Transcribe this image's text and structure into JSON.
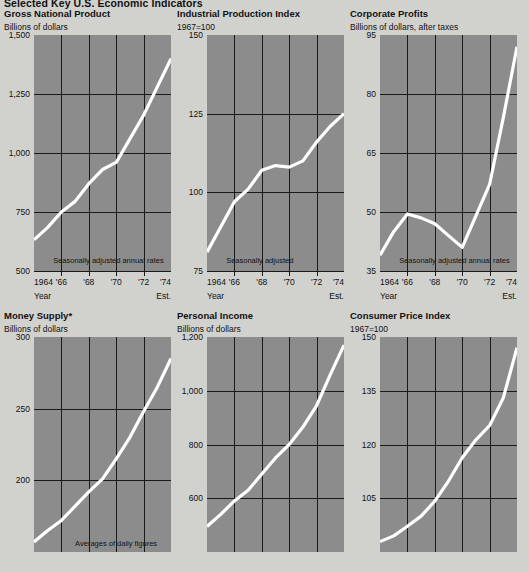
{
  "page": {
    "title": "Selected Key U.S. Economic Indicators"
  },
  "axis": {
    "x_tick_labels": [
      "1964",
      "'66",
      "'68",
      "'70",
      "'72",
      "'74"
    ],
    "x_foot_left": "Year",
    "x_foot_right": "Est."
  },
  "chart_data": [
    {
      "type": "line",
      "title": "Gross National Product",
      "units": "Billions of dollars",
      "ylabel": "Billions of dollars",
      "xlabel": "Year",
      "annotation": "Seasonally adjusted annual rates",
      "ylim": [
        500,
        1500
      ],
      "ytick_labels": [
        "1,500",
        "1,250",
        "1,000",
        "750",
        "500"
      ],
      "yticks": [
        1500,
        1250,
        1000,
        750,
        500
      ],
      "gridlines_y": [
        1250,
        1000,
        750
      ],
      "grid": true,
      "x": [
        1964,
        1965,
        1966,
        1967,
        1968,
        1969,
        1970,
        1971,
        1972,
        1973,
        1974
      ],
      "categories": [
        "1964",
        "'66",
        "'68",
        "'70",
        "'72",
        "'74"
      ],
      "values": [
        632,
        685,
        750,
        795,
        870,
        930,
        960,
        1060,
        1160,
        1280,
        1400
      ]
    },
    {
      "type": "line",
      "title": "Industrial Production Index",
      "units": "1967=100",
      "ylabel": "1967=100",
      "xlabel": "Year",
      "annotation": "Seasonally adjusted",
      "ylim": [
        75,
        150
      ],
      "ytick_labels": [
        "150",
        "125",
        "100",
        "75"
      ],
      "yticks": [
        150,
        125,
        100,
        75
      ],
      "gridlines_y": [
        125,
        100
      ],
      "grid": true,
      "x": [
        1964,
        1965,
        1966,
        1967,
        1968,
        1969,
        1970,
        1971,
        1972,
        1973,
        1974
      ],
      "categories": [
        "1964",
        "'66",
        "'68",
        "'70",
        "'72",
        "'74"
      ],
      "values": [
        81,
        89,
        97,
        101,
        107,
        108.5,
        108,
        110,
        116,
        121,
        125
      ]
    },
    {
      "type": "line",
      "title": "Corporate Profits",
      "units": "Billions of dollars, after taxes",
      "ylabel": "Billions of dollars, after taxes",
      "xlabel": "Year",
      "annotation": "Seasonally adjusted annual rates",
      "ylim": [
        35,
        95
      ],
      "ytick_labels": [
        "95",
        "80",
        "65",
        "50",
        "35"
      ],
      "yticks": [
        95,
        80,
        65,
        50,
        35
      ],
      "gridlines_y": [
        80,
        65,
        50
      ],
      "grid": true,
      "x": [
        1964,
        1965,
        1966,
        1967,
        1968,
        1969,
        1970,
        1971,
        1972,
        1973,
        1974
      ],
      "categories": [
        "1964",
        "'66",
        "'68",
        "'70",
        "'72",
        "'74"
      ],
      "values": [
        39,
        45,
        49.5,
        48.5,
        47,
        44,
        41,
        49,
        57,
        74,
        92
      ]
    },
    {
      "type": "line",
      "title": "Money Supply*",
      "units": "Billions of dollars",
      "ylabel": "Billions of dollars",
      "xlabel": "Year",
      "annotation": "Averages of daily figures",
      "ylim": [
        150,
        300
      ],
      "ytick_labels": [
        "300",
        "250",
        "200"
      ],
      "yticks": [
        300,
        250,
        200
      ],
      "gridlines_y": [
        250,
        200
      ],
      "grid": true,
      "x": [
        1964,
        1965,
        1966,
        1967,
        1968,
        1969,
        1970,
        1971,
        1972,
        1973,
        1974
      ],
      "categories": [
        "1964",
        "'66",
        "'68",
        "'70",
        "'72",
        "'74"
      ],
      "values": [
        157,
        165,
        172,
        182,
        192,
        201,
        215,
        230,
        248,
        265,
        285
      ]
    },
    {
      "type": "line",
      "title": "Personal Income",
      "units": "Billions of dollars",
      "ylabel": "Billions of dollars",
      "xlabel": "Year",
      "annotation": "",
      "ylim": [
        400,
        1200
      ],
      "ytick_labels": [
        "1,200",
        "1,000",
        "800",
        "600"
      ],
      "yticks": [
        1200,
        1000,
        800,
        600
      ],
      "gridlines_y": [
        1000,
        800,
        600
      ],
      "grid": true,
      "x": [
        1964,
        1965,
        1966,
        1967,
        1968,
        1969,
        1970,
        1971,
        1972,
        1973,
        1974
      ],
      "categories": [
        "1964",
        "'66",
        "'68",
        "'70",
        "'72",
        "'74"
      ],
      "values": [
        495,
        540,
        590,
        630,
        690,
        750,
        800,
        865,
        945,
        1060,
        1170
      ]
    },
    {
      "type": "line",
      "title": "Consumer Price Index",
      "units": "1967=100",
      "ylabel": "1967=100",
      "xlabel": "Year",
      "annotation": "",
      "ylim": [
        90,
        150
      ],
      "ytick_labels": [
        "150",
        "135",
        "120",
        "105"
      ],
      "yticks": [
        150,
        135,
        120,
        105
      ],
      "gridlines_y": [
        135,
        120,
        105
      ],
      "grid": true,
      "x": [
        1964,
        1965,
        1966,
        1967,
        1968,
        1969,
        1970,
        1971,
        1972,
        1973,
        1974
      ],
      "categories": [
        "1964",
        "'66",
        "'68",
        "'70",
        "'72",
        "'74"
      ],
      "values": [
        92.9,
        94.5,
        97.2,
        100,
        104.2,
        109.8,
        116.3,
        121.3,
        125.3,
        133,
        147
      ]
    }
  ]
}
